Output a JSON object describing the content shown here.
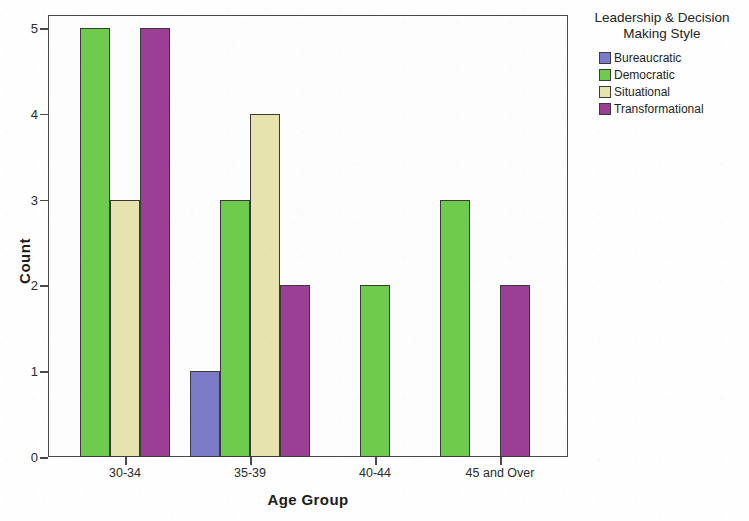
{
  "chart_data": {
    "type": "bar",
    "title": "",
    "xlabel": "Age Group",
    "ylabel": "Count",
    "categories": [
      "30-34",
      "35-39",
      "40-44",
      "45 and Over"
    ],
    "ylim": [
      0,
      5
    ],
    "yticks": [
      0,
      1,
      2,
      3,
      4,
      5
    ],
    "grid": false,
    "legend_position": "right",
    "legend_title": "Leadership & Decision Making Style",
    "series": [
      {
        "name": "Bureaucratic",
        "color": "#7b7bc8",
        "values": [
          0,
          1,
          0,
          0
        ]
      },
      {
        "name": "Democratic",
        "color": "#6ecb4c",
        "values": [
          5,
          3,
          2,
          3
        ]
      },
      {
        "name": "Situational",
        "color": "#e6e3ae",
        "values": [
          3,
          4,
          0,
          0
        ]
      },
      {
        "name": "Transformational",
        "color": "#9b3f96",
        "values": [
          5,
          2,
          0,
          2
        ]
      }
    ]
  },
  "axes": {
    "y_title": "Count",
    "x_title": "Age Group",
    "y_tick_labels": [
      "0",
      "1",
      "2",
      "3",
      "4",
      "5"
    ],
    "x_tick_labels": [
      "30-34",
      "35-39",
      "40-44",
      "45 and Over"
    ]
  },
  "legend": {
    "title_line1": "Leadership & Decision",
    "title_line2": "Making Style",
    "items": [
      {
        "label": "Bureaucratic",
        "color": "#7b7bc8"
      },
      {
        "label": "Democratic",
        "color": "#6ecb4c"
      },
      {
        "label": "Situational",
        "color": "#e6e3ae"
      },
      {
        "label": "Transformational",
        "color": "#9b3f96"
      }
    ]
  }
}
